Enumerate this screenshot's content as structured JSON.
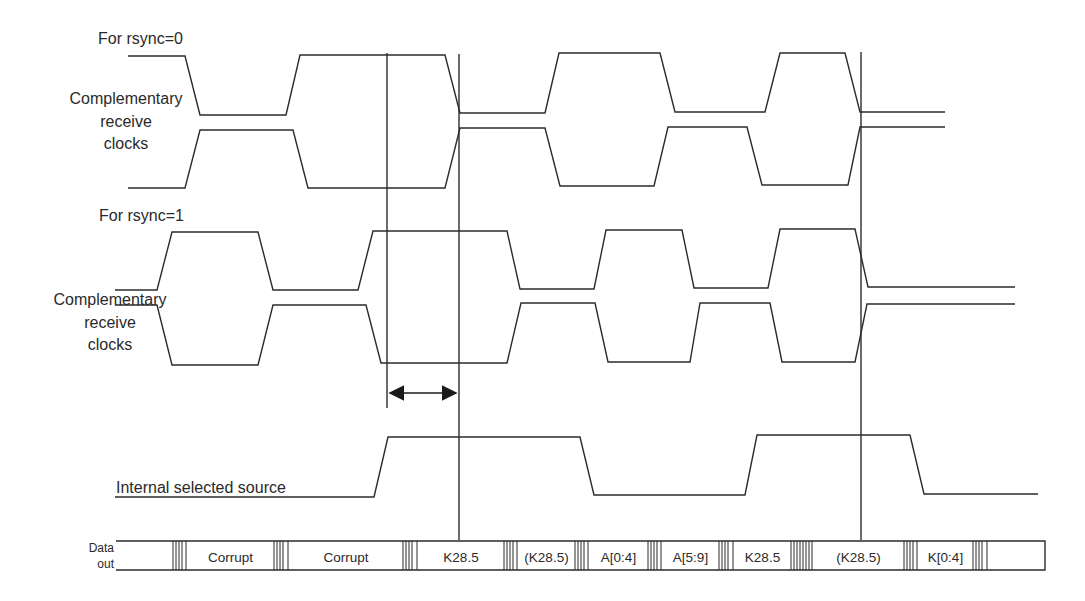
{
  "diagram": {
    "labels": {
      "rsync0_heading": "For rsync=0",
      "rsync1_heading": "For rsync=1",
      "clocks_line1": "Complementary",
      "clocks_line2": "receive",
      "clocks_line3": "clocks",
      "internal_source": "Internal selected source",
      "data_out_line1": "Data",
      "data_out_line2": "out"
    },
    "data_out_cells": [
      {
        "label": "Corrupt",
        "x": 242
      },
      {
        "label": "Corrupt",
        "x": 337
      },
      {
        "label": "K28.5",
        "x": 457
      },
      {
        "label": "(K28.5)",
        "x": 546
      },
      {
        "label": "A[0:4]",
        "x": 603
      },
      {
        "label": "A[5:9]",
        "x": 675
      },
      {
        "label": "K28.5",
        "x": 744
      },
      {
        "label": "(K28.5)",
        "x": 858
      },
      {
        "label": "K[0:4]",
        "x": 945
      }
    ],
    "signals": [
      {
        "name": "rsync0_clock_a",
        "description": "For rsync=0, first complementary receive clock"
      },
      {
        "name": "rsync0_clock_b",
        "description": "For rsync=0, second complementary receive clock"
      },
      {
        "name": "rsync1_clock_a",
        "description": "For rsync=1, first complementary receive clock"
      },
      {
        "name": "rsync1_clock_b",
        "description": "For rsync=1, second complementary receive clock"
      },
      {
        "name": "internal_selected_source",
        "description": "Internal selected source"
      },
      {
        "name": "data_out",
        "description": "Data out bus"
      }
    ],
    "annotations": {
      "interval_arrow": "double-headed arrow between vertical markers at switchover"
    },
    "colors": {
      "line": "#2b2b2b",
      "background": "#ffffff"
    }
  }
}
